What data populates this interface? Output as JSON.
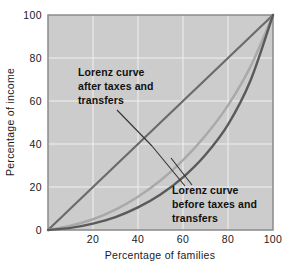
{
  "chart_data": {
    "type": "line",
    "title": "",
    "xlabel": "Percentage of families",
    "ylabel": "Percentage of income",
    "xlim": [
      0,
      100
    ],
    "ylim": [
      0,
      100
    ],
    "xticks": [
      20,
      40,
      60,
      80,
      100
    ],
    "yticks": [
      0,
      20,
      40,
      60,
      80,
      100
    ],
    "xtick_labels": [
      "20",
      "40",
      "60",
      "80",
      "100"
    ],
    "ytick_labels": [
      "0",
      "20",
      "40",
      "60",
      "80",
      "100"
    ],
    "grid": true,
    "grid_color": "#f0f0f0",
    "plot_background": "#cccccc",
    "legend": "none",
    "annotations": [
      {
        "id": "after-taxes-label",
        "lines": [
          "Lorenz curve",
          "after taxes and",
          "transfers"
        ],
        "text": "Lorenz curve after taxes and transfers",
        "points_to": {
          "x": 46,
          "y": 30
        }
      },
      {
        "id": "before-taxes-label",
        "lines": [
          "Lorenz curve",
          "before taxes and",
          "transfers"
        ],
        "text": "Lorenz curve before taxes and transfers",
        "points_to": {
          "x": 64,
          "y": 26
        }
      }
    ],
    "series": [
      {
        "name": "Line of equality",
        "color": "#6b6b6b",
        "width": 2.2,
        "x": [
          0,
          10,
          20,
          30,
          40,
          50,
          60,
          70,
          80,
          90,
          100
        ],
        "values": [
          0,
          10,
          20,
          30,
          40,
          50,
          60,
          70,
          80,
          90,
          100
        ]
      },
      {
        "name": "Lorenz curve after taxes and transfers",
        "color": "#a9a9a9",
        "width": 2.4,
        "x": [
          0,
          10,
          20,
          30,
          40,
          50,
          60,
          70,
          80,
          90,
          100
        ],
        "values": [
          0,
          2.0,
          5.0,
          9.5,
          15.5,
          23.0,
          32.5,
          44.0,
          58.0,
          76.0,
          100
        ]
      },
      {
        "name": "Lorenz curve before taxes and transfers",
        "color": "#5a5a5a",
        "width": 2.4,
        "x": [
          0,
          10,
          20,
          30,
          40,
          50,
          60,
          70,
          80,
          90,
          100
        ],
        "values": [
          0,
          1.0,
          3.0,
          6.0,
          10.5,
          16.5,
          24.5,
          35.0,
          49.0,
          69.5,
          100
        ]
      }
    ]
  }
}
